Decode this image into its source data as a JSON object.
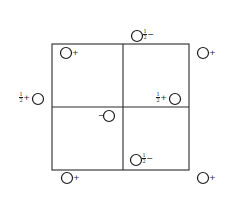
{
  "diagram": {
    "type": "symmetry-diagram",
    "cell": {
      "x0": 52,
      "y0": 44,
      "xm": 123,
      "ym": 107,
      "x1": 189,
      "y1": 170
    },
    "circle_radius": 5.5,
    "colors": {
      "line": "#2a2a2a",
      "ink": "#1a1a1a",
      "background": "#ffffff"
    },
    "atoms": [
      {
        "id": "a1",
        "cx": 66,
        "cy": 53,
        "label_side": "right",
        "fraction": "",
        "sign": "+"
      },
      {
        "id": "a2",
        "cx": 137,
        "cy": 36,
        "label_side": "right",
        "fraction": "1/2",
        "sign": "−"
      },
      {
        "id": "a3",
        "cx": 203,
        "cy": 53,
        "label_side": "right",
        "fraction": "",
        "sign": "+"
      },
      {
        "id": "a4",
        "cx": 38,
        "cy": 99,
        "label_side": "left",
        "fraction": "1/2",
        "sign": "+"
      },
      {
        "id": "a5",
        "cx": 175,
        "cy": 99,
        "label_side": "left",
        "fraction": "1/2",
        "sign": "+"
      },
      {
        "id": "a6",
        "cx": 109,
        "cy": 116,
        "label_side": "left",
        "fraction": "",
        "sign": "−"
      },
      {
        "id": "a7",
        "cx": 136,
        "cy": 160,
        "label_side": "right",
        "fraction": "1/2",
        "sign": "−"
      },
      {
        "id": "a8",
        "cx": 67,
        "cy": 178,
        "label_side": "right",
        "fraction": "",
        "sign": "+"
      },
      {
        "id": "a9",
        "cx": 203,
        "cy": 178,
        "label_side": "right",
        "fraction": "",
        "sign": "+"
      }
    ],
    "labels": {
      "a1": {
        "sign": "+"
      },
      "a2": {
        "num": "1",
        "den": "2",
        "sign": "−"
      },
      "a3": {
        "sign": "+"
      },
      "a4": {
        "num": "1",
        "den": "2",
        "sign": "+"
      },
      "a5": {
        "num": "1",
        "den": "2",
        "sign": "+"
      },
      "a6": {
        "sign": "−"
      },
      "a7": {
        "num": "1",
        "den": "2",
        "sign": "−"
      },
      "a8": {
        "sign": "+"
      },
      "a9": {
        "sign": "+"
      }
    }
  }
}
